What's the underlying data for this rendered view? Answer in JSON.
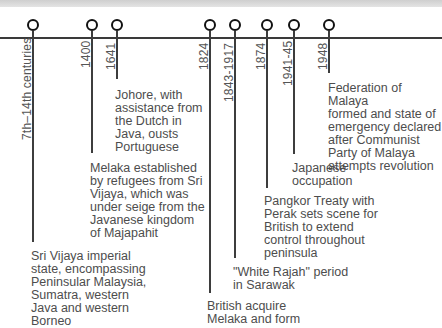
{
  "timeline": {
    "events": [
      {
        "date": "7th–14th centuries",
        "text": "Sri Vijaya imperial\nstate, encompassing\nPeninsular Malaysia,\nSumatra, western\nJava and western\nBorneo"
      },
      {
        "date": "1400",
        "text": "Melaka established\nby refugees from Sri\nVijaya, which was\nunder seige from the\nJavanese kingdom\nof Majapahit"
      },
      {
        "date": "1641",
        "text": "Johore, with\nassistance from\nthe Dutch in\nJava, ousts\nPortuguese"
      },
      {
        "date": "1824",
        "text": "British acquire\nMelaka and form"
      },
      {
        "date": "1843-1917",
        "text": "\"White Rajah\" period\nin Sarawak"
      },
      {
        "date": "1874",
        "text": "Pangkor Treaty with\nPerak sets scene for\nBritish to extend\ncontrol throughout\npeninsula"
      },
      {
        "date": "1941-45",
        "text": "Japanese\noccupation"
      },
      {
        "date": "1948",
        "text": "Federation of Malaya\nformed and state of\nemergency declared\nafter Communist\nParty of Malaya\nattempts revolution"
      }
    ]
  }
}
